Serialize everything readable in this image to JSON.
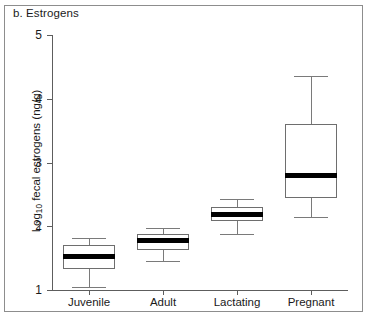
{
  "panel": {
    "label": "b. Estrogens"
  },
  "axes": {
    "y_title_main": "Log",
    "y_title_sub": "10",
    "y_title_rest": " fecal estrogens (ng/g)",
    "y_ticks": [
      "5",
      "4",
      "3",
      "2",
      "1"
    ],
    "x_labels": [
      "Juvenile",
      "Adult",
      "Lactating",
      "Pregnant"
    ]
  },
  "chart_data": {
    "type": "box",
    "title": "b. Estrogens",
    "xlabel": "",
    "ylabel": "Log10 fecal estrogens (ng/g)",
    "ylim": [
      1,
      5
    ],
    "yticks": [
      1,
      2,
      3,
      4,
      5
    ],
    "grid": false,
    "legend": null,
    "categories": [
      "Juvenile",
      "Adult",
      "Lactating",
      "Pregnant"
    ],
    "boxes": [
      {
        "category": "Juvenile",
        "whisker_low": 1.05,
        "q1": 1.33,
        "median": 1.52,
        "q3": 1.7,
        "whisker_high": 1.82
      },
      {
        "category": "Adult",
        "whisker_low": 1.45,
        "q1": 1.63,
        "median": 1.78,
        "q3": 1.88,
        "whisker_high": 1.97
      },
      {
        "category": "Lactating",
        "whisker_low": 1.88,
        "q1": 2.08,
        "median": 2.19,
        "q3": 2.3,
        "whisker_high": 2.42
      },
      {
        "category": "Pregnant",
        "whisker_low": 2.15,
        "q1": 2.45,
        "median": 2.8,
        "q3": 3.6,
        "whisker_high": 4.35
      }
    ]
  },
  "colors": {
    "axis": "#5d5d5d",
    "box_outline": "#6e6e6e",
    "median": "#000000",
    "whisker": "#7a7a7a",
    "frame": "#8d8d8d",
    "text": "#1a1a1a",
    "background": "#ffffff"
  }
}
